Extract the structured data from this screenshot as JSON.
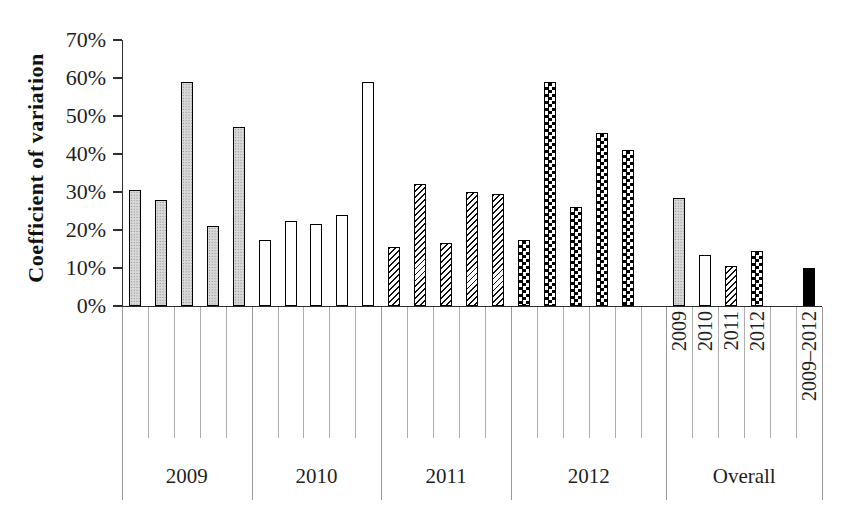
{
  "chart_data": {
    "type": "bar",
    "title": "",
    "ylabel": "Coefficient of variation",
    "xlabel": "",
    "unit": "%",
    "ylim": [
      0,
      70
    ],
    "ytick_values": [
      0,
      10,
      20,
      30,
      40,
      50,
      60,
      70
    ],
    "ytick_labels": [
      "0%",
      "10%",
      "20%",
      "30%",
      "40%",
      "50%",
      "60%",
      "70%"
    ],
    "grid": "off",
    "legend_position": "none",
    "fill_patterns": {
      "dots": "light-gray dotted fill (2009 series)",
      "white": "white fill (2010 series)",
      "hatch": "diagonal hatch fill (2011 series)",
      "checker": "checkerboard fill (2012 series)",
      "solid": "solid black fill (2009–2012 pooled)"
    },
    "groups": [
      {
        "label": "2009",
        "bars": [
          {
            "label": "",
            "pattern": "dots",
            "value": 30.5
          },
          {
            "label": "",
            "pattern": "dots",
            "value": 28
          },
          {
            "label": "",
            "pattern": "dots",
            "value": 59
          },
          {
            "label": "",
            "pattern": "dots",
            "value": 21
          },
          {
            "label": "",
            "pattern": "dots",
            "value": 47
          }
        ]
      },
      {
        "label": "2010",
        "bars": [
          {
            "label": "",
            "pattern": "white",
            "value": 17.5
          },
          {
            "label": "",
            "pattern": "white",
            "value": 22.5
          },
          {
            "label": "",
            "pattern": "white",
            "value": 21.5
          },
          {
            "label": "",
            "pattern": "white",
            "value": 24
          },
          {
            "label": "",
            "pattern": "white",
            "value": 59
          }
        ]
      },
      {
        "label": "2011",
        "bars": [
          {
            "label": "",
            "pattern": "hatch",
            "value": 15.5
          },
          {
            "label": "",
            "pattern": "hatch",
            "value": 32
          },
          {
            "label": "",
            "pattern": "hatch",
            "value": 16.5
          },
          {
            "label": "",
            "pattern": "hatch",
            "value": 30
          },
          {
            "label": "",
            "pattern": "hatch",
            "value": 29.5
          }
        ]
      },
      {
        "label": "2012",
        "bars": [
          {
            "label": "",
            "pattern": "checker",
            "value": 17.5
          },
          {
            "label": "",
            "pattern": "checker",
            "value": 59
          },
          {
            "label": "",
            "pattern": "checker",
            "value": 26
          },
          {
            "label": "",
            "pattern": "checker",
            "value": 45.5
          },
          {
            "label": "",
            "pattern": "checker",
            "value": 41
          },
          {
            "label": "",
            "pattern": "none",
            "value": null
          }
        ]
      },
      {
        "label": "Overall",
        "bars": [
          {
            "label": "2009",
            "pattern": "dots",
            "value": 28.5
          },
          {
            "label": "2010",
            "pattern": "white",
            "value": 13.5
          },
          {
            "label": "2011",
            "pattern": "hatch",
            "value": 10.5
          },
          {
            "label": "2012",
            "pattern": "checker",
            "value": 14.5
          },
          {
            "label": "",
            "pattern": "none",
            "value": null
          },
          {
            "label": "2009–2012",
            "pattern": "solid",
            "value": 10
          }
        ]
      }
    ],
    "colors": {
      "background": "#ffffff",
      "bar_border": "#000000",
      "axis": "#2e2e2e",
      "category_tick_line": "#adadad",
      "group_separator_line": "#999999",
      "text": "#1f1f1f"
    }
  }
}
